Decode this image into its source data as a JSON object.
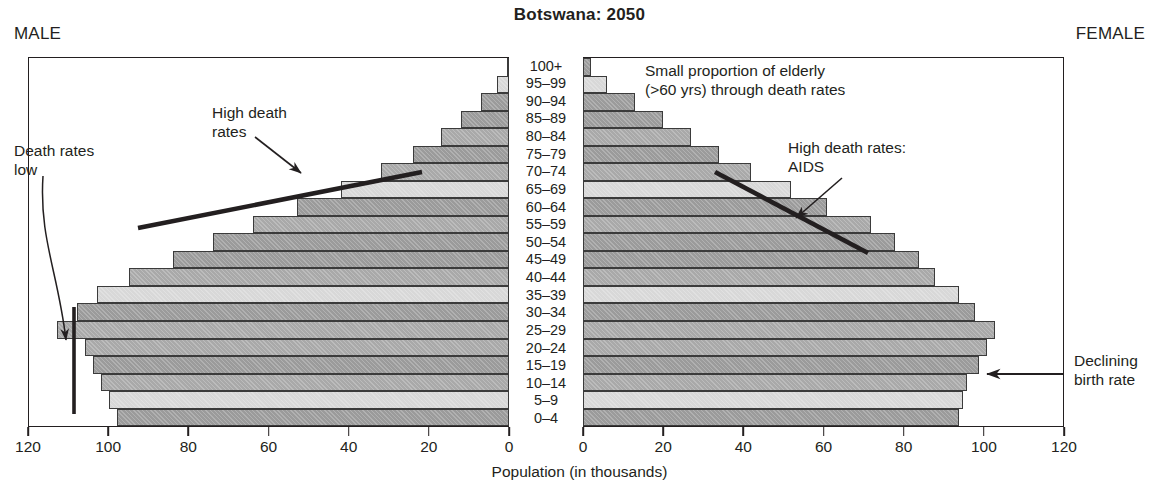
{
  "header": {
    "title": "Botswana: 2050",
    "male_label": "MALE",
    "female_label": "FEMALE"
  },
  "axis": {
    "xlabel": "Population (in thousands)",
    "ticks": [
      0,
      20,
      40,
      60,
      80,
      100,
      120
    ],
    "tick_labels": [
      "0",
      "20",
      "40",
      "60",
      "80",
      "100",
      "120"
    ],
    "male_tick_labels": [
      "120",
      "100",
      "80",
      "60",
      "40",
      "20",
      "0"
    ],
    "max": 120
  },
  "annotations": [
    {
      "id": "death-rates-low",
      "text": "Death rates\nlow"
    },
    {
      "id": "high-death-rates",
      "text": "High death\nrates"
    },
    {
      "id": "elderly-note",
      "text": "Small proportion of elderly\n(>60 yrs) through death rates"
    },
    {
      "id": "high-death-aids",
      "text": "High death rates:\nAIDS"
    },
    {
      "id": "declining-birth",
      "text": "Declining\nbirth rate"
    }
  ],
  "colors": {
    "ink": "#231f20",
    "bar_dark": "#9b9b9b",
    "bar_mid": "#a9a9a9",
    "bar_light": "#d8d8d8",
    "background": "#ffffff"
  },
  "chart_data": {
    "type": "bar",
    "subtype": "population-pyramid",
    "title": "Botswana: 2050",
    "xlabel": "Population (in thousands)",
    "ylabel": "Age group",
    "xlim": [
      0,
      120
    ],
    "grid": false,
    "legend": "none",
    "units": "thousands",
    "categories": [
      "100+",
      "95–99",
      "90–94",
      "85–89",
      "80–84",
      "75–79",
      "70–74",
      "65–69",
      "60–64",
      "55–59",
      "50–54",
      "45–49",
      "40–44",
      "35–39",
      "30–34",
      "25–29",
      "20–24",
      "15–19",
      "10–14",
      "5–9",
      "0–4"
    ],
    "series": [
      {
        "name": "Male",
        "side": "left",
        "values": [
          0.5,
          3,
          7,
          12,
          17,
          24,
          32,
          42,
          53,
          64,
          74,
          84,
          95,
          103,
          108,
          113,
          106,
          104,
          102,
          100,
          98
        ],
        "shades": [
          "light",
          "light",
          "dark",
          "dark",
          "mid",
          "dark",
          "mid",
          "light",
          "dark",
          "mid",
          "dark",
          "dark",
          "mid",
          "light",
          "dark",
          "mid",
          "mid",
          "dark",
          "mid",
          "light",
          "dark"
        ]
      },
      {
        "name": "Female",
        "side": "right",
        "values": [
          2,
          6,
          13,
          20,
          27,
          34,
          42,
          52,
          61,
          72,
          78,
          84,
          88,
          94,
          98,
          103,
          101,
          99,
          96,
          95,
          94
        ],
        "shades": [
          "dark",
          "light",
          "dark",
          "dark",
          "mid",
          "dark",
          "mid",
          "light",
          "dark",
          "mid",
          "dark",
          "dark",
          "mid",
          "light",
          "dark",
          "mid",
          "mid",
          "dark",
          "mid",
          "light",
          "dark"
        ]
      }
    ]
  }
}
